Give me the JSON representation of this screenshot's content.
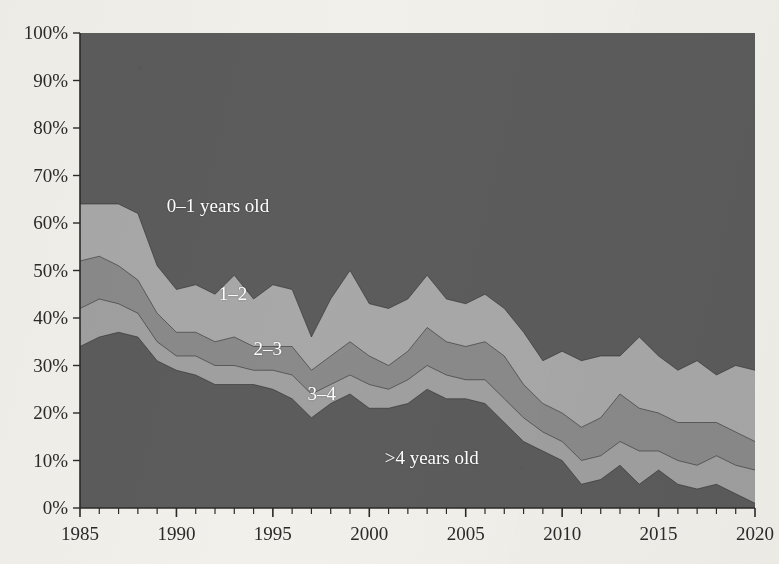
{
  "chart_data": {
    "type": "area",
    "stacked": true,
    "normalized_percent": true,
    "title": "",
    "subtitle": "",
    "xlabel": "",
    "ylabel": "",
    "xlim": [
      1985,
      2020
    ],
    "ylim": [
      0,
      100
    ],
    "grid": false,
    "legend_position": "in-plot-labels",
    "x": [
      1985,
      1986,
      1987,
      1988,
      1989,
      1990,
      1991,
      1992,
      1993,
      1994,
      1995,
      1996,
      1997,
      1998,
      1999,
      2000,
      2001,
      2002,
      2003,
      2004,
      2005,
      2006,
      2007,
      2008,
      2009,
      2010,
      2011,
      2012,
      2013,
      2014,
      2015,
      2016,
      2017,
      2018,
      2019,
      2020
    ],
    "xtick_labels": [
      "1985",
      "1990",
      "1995",
      "2000",
      "2005",
      "2010",
      "2015",
      "2020"
    ],
    "xtick_values": [
      1985,
      1990,
      1995,
      2000,
      2005,
      2010,
      2015,
      2020
    ],
    "ytick_labels": [
      "0%",
      "10%",
      "20%",
      "30%",
      "40%",
      "50%",
      "60%",
      "70%",
      "80%",
      "90%",
      "100%"
    ],
    "ytick_values": [
      0,
      10,
      20,
      30,
      40,
      50,
      60,
      70,
      80,
      90,
      100
    ],
    "series": [
      {
        "name": ">4 years old",
        "label": ">4 years old",
        "color": "#5c5c5c",
        "stack_order": 1,
        "values": [
          34,
          36,
          37,
          36,
          31,
          29,
          28,
          26,
          26,
          26,
          25,
          23,
          19,
          22,
          24,
          21,
          21,
          22,
          25,
          23,
          23,
          22,
          18,
          14,
          12,
          10,
          5,
          6,
          9,
          5,
          8,
          5,
          4,
          5,
          3,
          1
        ]
      },
      {
        "name": "3-4",
        "label": "3–4",
        "color": "#a0a0a0",
        "stack_order": 2,
        "values": [
          8,
          8,
          6,
          5,
          4,
          3,
          4,
          4,
          4,
          3,
          4,
          5,
          5,
          4,
          4,
          5,
          4,
          5,
          5,
          5,
          4,
          5,
          5,
          5,
          4,
          4,
          5,
          5,
          5,
          7,
          4,
          5,
          5,
          6,
          6,
          7
        ]
      },
      {
        "name": "2-3",
        "label": "2–3",
        "color": "#8a8a8a",
        "stack_order": 3,
        "values": [
          10,
          9,
          8,
          7,
          6,
          5,
          5,
          5,
          6,
          5,
          5,
          6,
          5,
          6,
          7,
          6,
          5,
          6,
          8,
          7,
          7,
          8,
          9,
          7,
          6,
          6,
          7,
          8,
          10,
          9,
          8,
          8,
          9,
          7,
          7,
          6
        ]
      },
      {
        "name": "1-2",
        "label": "1–2",
        "color": "#a8a8a8",
        "stack_order": 4,
        "values": [
          12,
          11,
          13,
          14,
          10,
          9,
          10,
          10,
          13,
          10,
          13,
          12,
          7,
          12,
          15,
          11,
          12,
          11,
          11,
          9,
          9,
          10,
          10,
          11,
          9,
          13,
          14,
          13,
          8,
          15,
          12,
          11,
          13,
          10,
          14,
          15
        ]
      },
      {
        "name": "0-1 years old",
        "label": "0–1 years old",
        "color": "#5c5c5c",
        "stack_order": 5,
        "values": [
          36,
          36,
          36,
          38,
          49,
          54,
          53,
          55,
          51,
          56,
          53,
          54,
          64,
          56,
          50,
          57,
          58,
          56,
          51,
          56,
          57,
          55,
          58,
          63,
          69,
          67,
          69,
          68,
          68,
          64,
          68,
          71,
          69,
          72,
          70,
          71
        ]
      }
    ],
    "cumulative_boundaries": {
      "note": "Cumulative top edge of each band from bottom, in percent",
      "gt4_top": [
        34,
        36,
        37,
        36,
        31,
        29,
        28,
        26,
        26,
        26,
        25,
        23,
        19,
        22,
        24,
        21,
        21,
        22,
        25,
        23,
        23,
        22,
        18,
        14,
        12,
        10,
        5,
        6,
        9,
        5,
        8,
        5,
        4,
        5,
        3,
        1
      ],
      "b34_top": [
        42,
        44,
        43,
        41,
        35,
        32,
        32,
        30,
        30,
        29,
        29,
        28,
        24,
        26,
        28,
        26,
        25,
        27,
        30,
        28,
        27,
        27,
        23,
        19,
        16,
        14,
        10,
        11,
        14,
        12,
        12,
        10,
        9,
        11,
        9,
        8
      ],
      "b23_top": [
        52,
        53,
        51,
        48,
        41,
        37,
        37,
        35,
        36,
        34,
        34,
        34,
        29,
        32,
        35,
        32,
        30,
        33,
        38,
        35,
        34,
        35,
        32,
        26,
        22,
        20,
        17,
        19,
        24,
        21,
        20,
        18,
        18,
        18,
        16,
        14
      ],
      "b12_top": [
        64,
        64,
        64,
        62,
        51,
        46,
        47,
        45,
        49,
        44,
        47,
        46,
        36,
        44,
        50,
        43,
        42,
        44,
        49,
        44,
        43,
        45,
        42,
        37,
        31,
        33,
        31,
        32,
        32,
        36,
        32,
        29,
        31,
        28,
        30,
        29
      ],
      "total_top": [
        100,
        100,
        100,
        100,
        100,
        100,
        100,
        100,
        100,
        100,
        100,
        100,
        100,
        100,
        100,
        100,
        100,
        100,
        100,
        100,
        100,
        100,
        100,
        100,
        100,
        100,
        100,
        100,
        100,
        100,
        100,
        100,
        100,
        100,
        100,
        100
      ]
    },
    "series_labels": [
      {
        "text": "0–1 years old",
        "x_year": 1989.5,
        "y_percent": 63.5
      },
      {
        "text": "1–2",
        "x_year": 1992.2,
        "y_percent": 45.0
      },
      {
        "text": "2–3",
        "x_year": 1994.0,
        "y_percent": 33.5
      },
      {
        "text": "3–4",
        "x_year": 1996.8,
        "y_percent": 24.0
      },
      {
        "text": "&gt;4 years old",
        "x_year": 2000.8,
        "y_percent": 10.5
      }
    ],
    "colors": {
      "background": "#f2f0eb",
      "band_dark": "#5c5c5c",
      "band_light": "#a8a8a8",
      "band_medium": "#8a8a8a",
      "band_mid_light": "#a0a0a0",
      "axis": "#2a2a2a",
      "label_text": "#ffffff",
      "tick_text": "#2a2a2a"
    }
  }
}
